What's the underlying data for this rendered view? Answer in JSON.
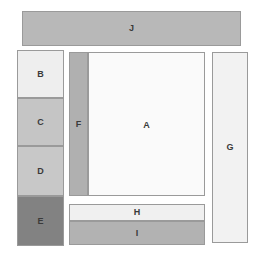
{
  "diagram": {
    "canvas": {
      "width": 262,
      "height": 263,
      "background": "#ffffff"
    },
    "border_color": "#9a9a9a",
    "regions": [
      {
        "id": "J",
        "label": "J",
        "role": "top-banner",
        "color": "#b8b8b8",
        "x": 22,
        "y": 11,
        "width": 219,
        "height": 35
      },
      {
        "id": "B",
        "label": "B",
        "role": "left-column-block-1",
        "color": "#eeeeee",
        "x": 17,
        "y": 50,
        "width": 47,
        "height": 48
      },
      {
        "id": "C",
        "label": "C",
        "role": "left-column-block-2",
        "color": "#c5c5c5",
        "x": 17,
        "y": 98,
        "width": 47,
        "height": 48
      },
      {
        "id": "D",
        "label": "D",
        "role": "left-column-block-3",
        "color": "#c8c8c8",
        "x": 17,
        "y": 146,
        "width": 47,
        "height": 50
      },
      {
        "id": "E",
        "label": "E",
        "role": "left-column-block-4",
        "color": "#828282",
        "x": 17,
        "y": 196,
        "width": 47,
        "height": 50
      },
      {
        "id": "F",
        "label": "F",
        "role": "inner-left-sidebar",
        "color": "#b0b0b0",
        "x": 69,
        "y": 52,
        "width": 19,
        "height": 144
      },
      {
        "id": "A",
        "label": "A",
        "role": "main-content",
        "color": "#fafafa",
        "x": 88,
        "y": 52,
        "width": 117,
        "height": 144
      },
      {
        "id": "G",
        "label": "G",
        "role": "right-rail",
        "color": "#f2f2f2",
        "x": 212,
        "y": 52,
        "width": 36,
        "height": 191
      },
      {
        "id": "H",
        "label": "H",
        "role": "bottom-bar-upper",
        "color": "#f0f0f0",
        "x": 69,
        "y": 204,
        "width": 136,
        "height": 17
      },
      {
        "id": "I",
        "label": "I",
        "role": "bottom-bar-lower",
        "color": "#b2b2b2",
        "x": 69,
        "y": 221,
        "width": 136,
        "height": 24
      }
    ]
  }
}
